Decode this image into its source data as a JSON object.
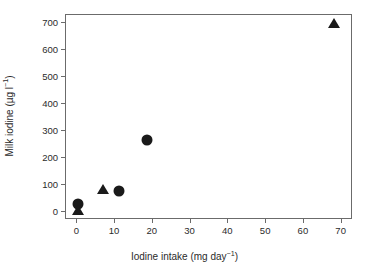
{
  "chart_data": {
    "type": "scatter",
    "title": "",
    "xlabel": "Iodine intake (mg day⁻¹)",
    "ylabel": "Milk iodine (µg l⁻¹)",
    "xlim": [
      -3,
      73
    ],
    "ylim": [
      -30,
      730
    ],
    "xticks": [
      0,
      10,
      20,
      30,
      40,
      50,
      60,
      70
    ],
    "yticks": [
      0,
      100,
      200,
      300,
      400,
      500,
      600,
      700
    ],
    "xtick_labels": [
      "0",
      "10",
      "20",
      "30",
      "40",
      "50",
      "60",
      "70"
    ],
    "ytick_labels": [
      "0",
      "100",
      "200",
      "300",
      "400",
      "500",
      "600",
      "700"
    ],
    "grid": false,
    "legend": "none",
    "marker_color": "#1a1a1a",
    "frame_color": "#6b6b6b",
    "background": "#ffffff",
    "series": [
      {
        "name": "circle-series",
        "marker": "circle",
        "points": [
          {
            "x": 0.3,
            "y": 30
          },
          {
            "x": 11.0,
            "y": 78
          },
          {
            "x": 18.4,
            "y": 266
          }
        ]
      },
      {
        "name": "triangle-series",
        "marker": "triangle",
        "points": [
          {
            "x": 0.3,
            "y": 8
          },
          {
            "x": 6.8,
            "y": 84
          },
          {
            "x": 68.0,
            "y": 700
          }
        ]
      }
    ]
  }
}
